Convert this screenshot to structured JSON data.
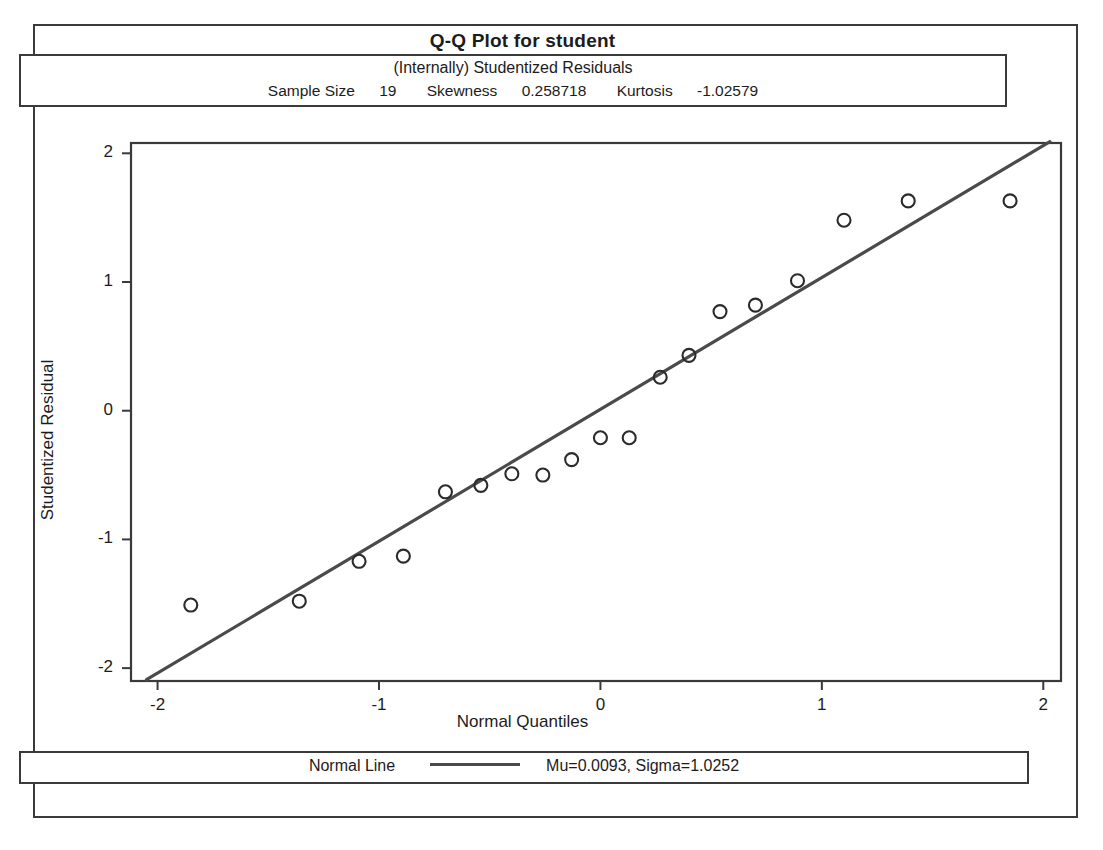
{
  "title": "Q-Q Plot for student",
  "header": {
    "subtitle": "(Internally) Studentized Residuals",
    "stats": [
      {
        "label": "Sample Size",
        "value": "19"
      },
      {
        "label": "Skewness",
        "value": "0.258718"
      },
      {
        "label": "Kurtosis",
        "value": "-1.02579"
      }
    ]
  },
  "legend": {
    "series_label": "Normal Line",
    "params": "Mu=0.0093, Sigma=1.0252"
  },
  "colors": {
    "frame": "#3a3a3a",
    "line": "#4a4a4a",
    "marker": "#2b2b2b",
    "text": "#1c1c1c",
    "background": "#ffffff"
  },
  "chart_data": {
    "type": "scatter",
    "title": "Q-Q Plot for student",
    "subtitle": "(Internally) Studentized Residuals",
    "xlabel": "Normal Quantiles",
    "ylabel": "Studentized Residual",
    "xlim": [
      -2.12,
      2.08
    ],
    "ylim": [
      -2.1,
      2.08
    ],
    "xticks": [
      -2,
      -1,
      0,
      1,
      2
    ],
    "xticklabels": [
      "-2",
      "-1",
      "0",
      "1",
      "2"
    ],
    "yticks": [
      -2,
      -1,
      0,
      1,
      2
    ],
    "yticklabels": [
      "-2",
      "-1",
      "0",
      "1",
      "2"
    ],
    "grid": false,
    "legend_position": "bottom",
    "sample_size": 19,
    "skewness": 0.258718,
    "kurtosis": -1.02579,
    "series": [
      {
        "name": "Studentized residuals",
        "marker": "open-circle",
        "x": [
          -1.85,
          -1.36,
          -1.09,
          -0.89,
          -0.7,
          -0.54,
          -0.4,
          -0.26,
          -0.13,
          0.0,
          0.13,
          0.27,
          0.4,
          0.54,
          0.7,
          0.89,
          1.1,
          1.39,
          1.85
        ],
        "y": [
          -1.51,
          -1.48,
          -1.17,
          -1.13,
          -0.63,
          -0.58,
          -0.49,
          -0.5,
          -0.38,
          -0.21,
          -0.21,
          0.26,
          0.43,
          0.77,
          0.82,
          1.01,
          1.48,
          1.63,
          1.63
        ]
      },
      {
        "name": "Normal Line",
        "type": "line",
        "mu": 0.0093,
        "sigma": 1.0252,
        "x_endpoints": [
          -2.05,
          2.03
        ],
        "y_endpoints": [
          -2.09,
          2.09
        ]
      }
    ]
  }
}
